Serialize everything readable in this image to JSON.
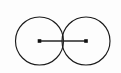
{
  "figure": {
    "background_color": "#fdfdfd",
    "stroke_color": "#1a1a1a",
    "segment_color": "#262626",
    "dot_color": "#111111",
    "canvas": {
      "width": 121,
      "height": 73
    },
    "circles": [
      {
        "name": "left-circle",
        "label": "",
        "cx": 39.5,
        "cy": 41,
        "r": 24,
        "stroke_width": 1.15
      },
      {
        "name": "right-circle",
        "label": "",
        "cx": 86,
        "cy": 41,
        "r": 24,
        "stroke_width": 1.15
      }
    ],
    "segment": {
      "name": "center-to-center-segment",
      "label": "",
      "x1": 39.5,
      "y1": 41,
      "x2": 86,
      "y2": 41,
      "stroke_width": 1.5,
      "length": 46.5
    },
    "center_points": [
      {
        "name": "left-center-point",
        "label": "",
        "cx": 39.5,
        "cy": 41,
        "size": 3.6
      },
      {
        "name": "right-center-point",
        "label": "",
        "cx": 86,
        "cy": 41,
        "size": 3.6
      }
    ],
    "intersection": {
      "name": "lens-region",
      "label": "",
      "upper_x": 62.75,
      "upper_y": 21.4,
      "lower_x": 62.75,
      "lower_y": 60.6
    }
  }
}
